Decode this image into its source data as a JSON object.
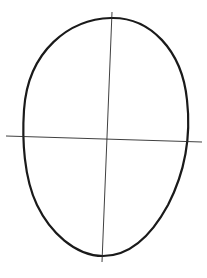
{
  "image": {
    "description": "Pencil sketch of an egg-shaped head outline with vertical and horizontal guide lines",
    "stroke_color": "#1a1a1a",
    "guide_color": "#2a2a2a",
    "background": "#ffffff"
  },
  "shapes": {
    "outline": {
      "path": "M111 18 C 150 17, 182 50, 187 100 C 191 135, 186 170, 168 205 C 150 238, 128 256, 103 256 C 75 256, 50 232, 37 205 C 24 178, 22 140, 24 110 C 28 50, 70 19, 111 18 Z"
    },
    "vertical_guide": {
      "x1": 112,
      "y1": 12,
      "x2": 102,
      "y2": 262
    },
    "horizontal_guide": {
      "x1": 6,
      "y1": 136,
      "x2": 202,
      "y2": 142
    }
  }
}
